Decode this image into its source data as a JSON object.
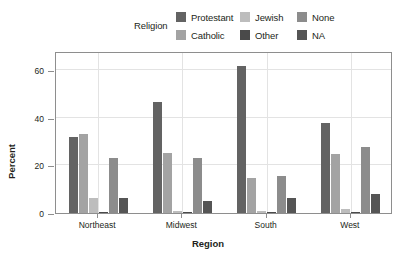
{
  "chart_data": {
    "type": "bar",
    "title": "",
    "xlabel": "Region",
    "ylabel": "Percent",
    "categories": [
      "Northeast",
      "Midwest",
      "South",
      "West"
    ],
    "legend_title": "Religion",
    "legend_position": "top",
    "grid": true,
    "ylim": [
      0,
      68
    ],
    "yticks": [
      0,
      20,
      40,
      60
    ],
    "ytick_labels": [
      "0",
      "20",
      "40",
      "60"
    ],
    "series": [
      {
        "name": "Protestant",
        "color": "#636363",
        "values": [
          32.0,
          46.8,
          61.8,
          37.6
        ]
      },
      {
        "name": "Catholic",
        "color": "#a3a3a3",
        "values": [
          33.0,
          25.0,
          14.5,
          24.6
        ]
      },
      {
        "name": "Jewish",
        "color": "#bdbdbd",
        "values": [
          6.2,
          0.8,
          0.9,
          1.5
        ]
      },
      {
        "name": "Other",
        "color": "#4a4a4a",
        "values": [
          0.5,
          0.4,
          0.5,
          0.4
        ]
      },
      {
        "name": "None",
        "color": "#8c8c8c",
        "values": [
          23.0,
          23.2,
          15.6,
          27.6
        ]
      },
      {
        "name": "NA",
        "color": "#555555",
        "values": [
          6.1,
          4.9,
          6.2,
          8.0
        ]
      }
    ]
  }
}
